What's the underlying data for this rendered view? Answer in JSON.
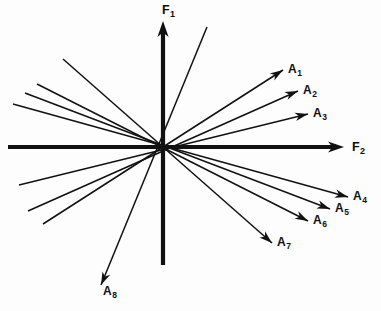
{
  "figure": {
    "background_color": "#fdfdfd",
    "stroke_color": "#111111",
    "width": 381,
    "height": 311,
    "origin": {
      "x": 163,
      "y": 147
    }
  },
  "axes": {
    "vertical": {
      "name": "F1",
      "label_main": "F",
      "label_sub": "1",
      "label_x": 162,
      "label_y": 4,
      "tip_x": 163,
      "tip_y": 21,
      "tail_x": 163,
      "tail_y": 265,
      "width": 4.2
    },
    "horizontal": {
      "name": "F2",
      "label_main": "F",
      "label_sub": "2",
      "label_x": 352,
      "label_y": 141,
      "tip_x": 344,
      "tip_y": 147,
      "tail_x": 8,
      "tail_y": 147,
      "width": 4.2
    }
  },
  "vectors": [
    {
      "name": "A1",
      "label_main": "A",
      "label_sub": "1",
      "tip_x": 283,
      "tip_y": 70,
      "back_x": 43,
      "back_y": 224,
      "label_x": 288,
      "label_y": 63
    },
    {
      "name": "A2",
      "label_main": "A",
      "label_sub": "2",
      "tip_x": 298,
      "tip_y": 91,
      "back_x": 28,
      "back_y": 211,
      "label_x": 303,
      "label_y": 84
    },
    {
      "name": "A3",
      "label_main": "A",
      "label_sub": "3",
      "tip_x": 308,
      "tip_y": 114,
      "back_x": 19,
      "back_y": 185,
      "label_x": 313,
      "label_y": 107
    },
    {
      "name": "A4",
      "label_main": "A",
      "label_sub": "4",
      "tip_x": 348,
      "tip_y": 197,
      "back_x": 13,
      "back_y": 104,
      "label_x": 353,
      "label_y": 190
    },
    {
      "name": "A5",
      "label_main": "A",
      "label_sub": "5",
      "tip_x": 330,
      "tip_y": 209,
      "back_x": 25,
      "back_y": 93,
      "label_x": 335,
      "label_y": 202
    },
    {
      "name": "A6",
      "label_main": "A",
      "label_sub": "6",
      "tip_x": 308,
      "tip_y": 221,
      "back_x": 37,
      "back_y": 84,
      "label_x": 313,
      "label_y": 214
    },
    {
      "name": "A7",
      "label_main": "A",
      "label_sub": "7",
      "tip_x": 272,
      "tip_y": 243,
      "back_x": 63,
      "back_y": 59,
      "label_x": 277,
      "label_y": 236
    },
    {
      "name": "A8",
      "label_main": "A",
      "label_sub": "8",
      "tip_x": 101,
      "tip_y": 285,
      "back_x": 207,
      "back_y": 27,
      "label_x": 103,
      "label_y": 285
    }
  ]
}
